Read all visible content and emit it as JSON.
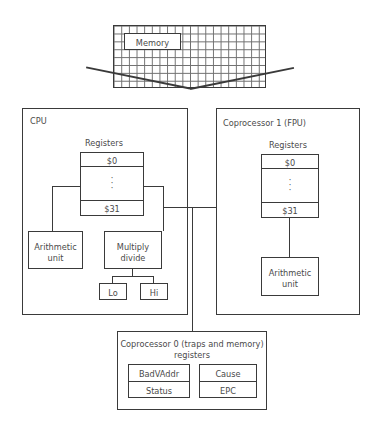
{
  "diagram": {
    "memory": {
      "label": "Memory",
      "grid_cols": 20,
      "grid_rows": 8
    },
    "cpu": {
      "label": "CPU",
      "registers_label": "Registers",
      "register_first": "$0",
      "register_last": "$31",
      "register_ellipsis": "·",
      "arithmetic_unit": "Arithmetic\nunit",
      "arithmetic_unit_line1": "Arithmetic",
      "arithmetic_unit_line2": "unit",
      "multiply_divide_line1": "Multiply",
      "multiply_divide_line2": "divide",
      "lo": "Lo",
      "hi": "Hi"
    },
    "coprocessor1": {
      "label": "Coprocessor 1 (FPU)",
      "registers_label": "Registers",
      "register_first": "$0",
      "register_last": "$31",
      "arithmetic_unit_line1": "Arithmetic",
      "arithmetic_unit_line2": "unit"
    },
    "coprocessor0": {
      "title_line1": "Coprocessor 0 (traps and memory)",
      "title_line2": "registers",
      "registers": [
        [
          "BadVAddr",
          "Cause"
        ],
        [
          "Status",
          "EPC"
        ]
      ],
      "badvaddr": "BadVAddr",
      "status": "Status",
      "cause": "Cause",
      "epc": "EPC"
    },
    "colors": {
      "stroke": "#3a3a3a",
      "grid": "#6f6f6f",
      "text": "#4a4a4a",
      "background": "#ffffff"
    }
  }
}
